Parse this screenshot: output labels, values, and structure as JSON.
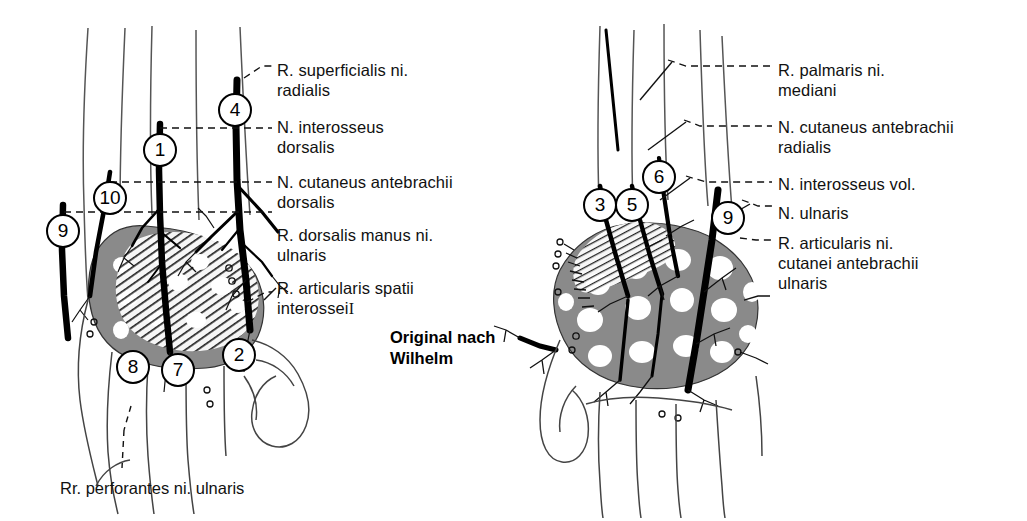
{
  "figure": {
    "title_credit": "Original nach\nWilhelm",
    "bottom_caption": "Rr. perforantes ni. ulnaris",
    "background_color": "#ffffff",
    "ink_color": "#000000",
    "shade_gray": "#8a8a8a"
  },
  "left_panel": {
    "name": "dorsal-hand-innervation",
    "labels": [
      {
        "id": "l1",
        "text": "R. superficialis ni.\n  radialis",
        "x": 277,
        "y": 60
      },
      {
        "id": "l2",
        "text": "N. interosseus\n  dorsalis",
        "x": 277,
        "y": 117
      },
      {
        "id": "l3",
        "text": "N. cutaneus antebrachii\n  dorsalis",
        "x": 277,
        "y": 172
      },
      {
        "id": "l4",
        "text": "R. dorsalis manus ni.\n  ulnaris",
        "x": 277,
        "y": 225
      },
      {
        "id": "l5",
        "text": "R. articularis spatii\n  interossei",
        "x": 277,
        "y": 278,
        "suffix_roman": "I"
      }
    ],
    "markers": [
      {
        "num": "4",
        "x": 235,
        "y": 110
      },
      {
        "num": "1",
        "x": 160,
        "y": 150
      },
      {
        "num": "10",
        "x": 110,
        "y": 198
      },
      {
        "num": "9",
        "x": 63,
        "y": 231
      },
      {
        "num": "8",
        "x": 133,
        "y": 367
      },
      {
        "num": "7",
        "x": 178,
        "y": 370
      },
      {
        "num": "2",
        "x": 239,
        "y": 355
      }
    ]
  },
  "right_panel": {
    "name": "volar-hand-innervation",
    "labels": [
      {
        "id": "r1",
        "text": "R. palmaris ni.\n  mediani",
        "x": 778,
        "y": 60
      },
      {
        "id": "r2",
        "text": "N. cutaneus antebrachii\n  radialis",
        "x": 778,
        "y": 117
      },
      {
        "id": "r3",
        "text": "N. interosseus vol.",
        "x": 778,
        "y": 174
      },
      {
        "id": "r4",
        "text": "N. ulnaris",
        "x": 778,
        "y": 203
      },
      {
        "id": "r5",
        "text": "R. articularis ni.\n  cutanei antebrachii\n  ulnaris",
        "x": 778,
        "y": 233
      }
    ],
    "markers": [
      {
        "num": "3",
        "x": 600,
        "y": 205
      },
      {
        "num": "5",
        "x": 632,
        "y": 205
      },
      {
        "num": "6",
        "x": 659,
        "y": 177
      },
      {
        "num": "9",
        "x": 728,
        "y": 218
      }
    ]
  },
  "credit_block": {
    "x": 390,
    "y": 327
  },
  "bottom_caption_pos": {
    "x": 60,
    "y": 478
  }
}
